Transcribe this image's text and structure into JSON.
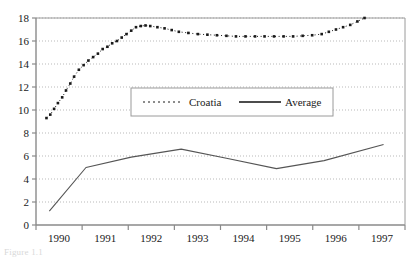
{
  "caption": "Figure 1.1",
  "chart_data": {
    "type": "line",
    "title": "",
    "xlabel": "",
    "ylabel": "",
    "xlim": [
      1990,
      1997.75
    ],
    "ylim": [
      0,
      18
    ],
    "ytick_step": 2,
    "yticks": [
      0,
      2,
      4,
      6,
      8,
      10,
      12,
      14,
      16,
      18
    ],
    "xticks": [
      1990,
      1991,
      1992,
      1993,
      1994,
      1995,
      1996,
      1997
    ],
    "xtick_labels": [
      "1990",
      "1991",
      "1992",
      "1993",
      "1994",
      "1995",
      "1996",
      "1997"
    ],
    "grid": "horizontal-dotted",
    "legend_position": "center",
    "series": [
      {
        "name": "Croatia",
        "style": "dotted-markers",
        "color": "#1a1a1a",
        "x": [
          1990.22,
          1990.3,
          1990.38,
          1990.46,
          1990.55,
          1990.63,
          1990.72,
          1990.8,
          1990.9,
          1991.0,
          1991.1,
          1991.2,
          1991.3,
          1991.4,
          1991.5,
          1991.6,
          1991.7,
          1991.8,
          1991.9,
          1992.0,
          1992.1,
          1992.2,
          1992.3,
          1992.4,
          1992.55,
          1992.7,
          1992.85,
          1993.0,
          1993.2,
          1993.4,
          1993.6,
          1993.8,
          1994.0,
          1994.2,
          1994.4,
          1994.6,
          1994.8,
          1995.0,
          1995.2,
          1995.4,
          1995.6,
          1995.8,
          1996.0,
          1996.15,
          1996.3,
          1996.45,
          1996.6,
          1996.75,
          1996.9
        ],
        "y": [
          9.3,
          9.6,
          10.1,
          10.6,
          11.1,
          11.7,
          12.3,
          12.9,
          13.5,
          13.9,
          14.3,
          14.6,
          14.9,
          15.3,
          15.5,
          15.8,
          16.0,
          16.3,
          16.6,
          16.9,
          17.2,
          17.3,
          17.35,
          17.3,
          17.2,
          17.1,
          16.95,
          16.8,
          16.7,
          16.6,
          16.55,
          16.5,
          16.45,
          16.4,
          16.4,
          16.4,
          16.4,
          16.4,
          16.4,
          16.4,
          16.45,
          16.5,
          16.6,
          16.8,
          17.0,
          17.2,
          17.4,
          17.7,
          18.0
        ]
      },
      {
        "name": "Average",
        "style": "solid",
        "color": "#555555",
        "x": [
          1990.28,
          1991.05,
          1992.0,
          1993.05,
          1994.0,
          1995.05,
          1996.05,
          1997.3
        ],
        "y": [
          1.2,
          5.0,
          5.9,
          6.6,
          5.8,
          4.9,
          5.6,
          7.0
        ]
      }
    ],
    "legend": [
      {
        "label": "Croatia",
        "style": "dotted"
      },
      {
        "label": "Average",
        "style": "solid"
      }
    ]
  }
}
